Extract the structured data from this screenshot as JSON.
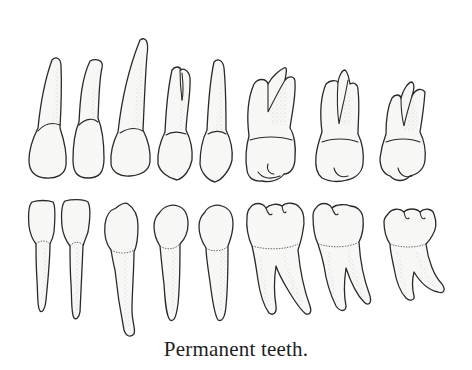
{
  "figure": {
    "caption": "Permanent teeth.",
    "style": "stippled line-art illustration",
    "colors": {
      "background": "#ffffff",
      "ink": "#2a2a2a",
      "tooth_fill": "#f7f7f5"
    },
    "rows": [
      {
        "name": "upper",
        "teeth": [
          {
            "id": "upper-central-incisor",
            "label": "central incisor"
          },
          {
            "id": "upper-lateral-incisor",
            "label": "lateral incisor"
          },
          {
            "id": "upper-canine",
            "label": "canine"
          },
          {
            "id": "upper-first-premolar",
            "label": "first premolar"
          },
          {
            "id": "upper-second-premolar",
            "label": "second premolar"
          },
          {
            "id": "upper-first-molar",
            "label": "first molar"
          },
          {
            "id": "upper-second-molar",
            "label": "second molar"
          },
          {
            "id": "upper-third-molar",
            "label": "third molar"
          }
        ]
      },
      {
        "name": "lower",
        "teeth": [
          {
            "id": "lower-central-incisor",
            "label": "central incisor"
          },
          {
            "id": "lower-lateral-incisor",
            "label": "lateral incisor"
          },
          {
            "id": "lower-canine",
            "label": "canine"
          },
          {
            "id": "lower-first-premolar",
            "label": "first premolar"
          },
          {
            "id": "lower-second-premolar",
            "label": "second premolar"
          },
          {
            "id": "lower-first-molar",
            "label": "first molar"
          },
          {
            "id": "lower-second-molar",
            "label": "second molar"
          },
          {
            "id": "lower-third-molar",
            "label": "third molar"
          }
        ]
      }
    ]
  }
}
